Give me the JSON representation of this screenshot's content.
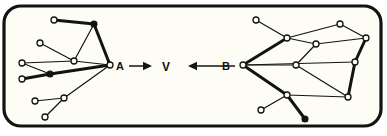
{
  "figure": {
    "background_color": "#ffffff",
    "panel_fill": "#fdfdf6",
    "stroke_color": "#131311",
    "node_fill": "#fdfdf6",
    "frame": {
      "x": 4,
      "y": 6,
      "width": 377,
      "height": 120,
      "radius": 17,
      "stroke_width": 3.2
    }
  },
  "labels": {
    "left_graph": "A",
    "center": "V",
    "right_graph": "B"
  },
  "arrows": {
    "left_to_center": {
      "from_label": "A",
      "to_label": "V",
      "direction": "right",
      "x1": 129,
      "x2": 152,
      "y": 66
    },
    "right_to_center": {
      "from_label": "B",
      "to_label": "V",
      "direction": "left",
      "x1": 235,
      "x2": 188,
      "y": 66
    }
  },
  "graph_left": {
    "anchor_label": "A",
    "anchor": {
      "x": 110,
      "y": 65
    },
    "nodes": [
      {
        "id": "L0",
        "x": 110,
        "y": 65,
        "r": 3.0,
        "style": "open"
      },
      {
        "id": "L1",
        "x": 54,
        "y": 20,
        "r": 3.0,
        "style": "open"
      },
      {
        "id": "L2",
        "x": 94,
        "y": 24,
        "r": 3.0,
        "style": "solid"
      },
      {
        "id": "L3",
        "x": 40,
        "y": 43,
        "r": 3.0,
        "style": "open"
      },
      {
        "id": "L4",
        "x": 74,
        "y": 61,
        "r": 3.0,
        "style": "open"
      },
      {
        "id": "L5",
        "x": 22,
        "y": 63,
        "r": 3.0,
        "style": "open"
      },
      {
        "id": "L6",
        "x": 50,
        "y": 74,
        "r": 3.0,
        "style": "solid"
      },
      {
        "id": "L7",
        "x": 22,
        "y": 79,
        "r": 3.0,
        "style": "open"
      },
      {
        "id": "L8",
        "x": 35,
        "y": 101,
        "r": 3.0,
        "style": "open"
      },
      {
        "id": "L9",
        "x": 64,
        "y": 98,
        "r": 3.0,
        "style": "open"
      },
      {
        "id": "L10",
        "x": 45,
        "y": 117,
        "r": 3.0,
        "style": "open"
      }
    ],
    "edges": [
      {
        "from": "L1",
        "to": "L2",
        "weight": "thick"
      },
      {
        "from": "L2",
        "to": "L0",
        "weight": "thick"
      },
      {
        "from": "L2",
        "to": "L4",
        "weight": "thin"
      },
      {
        "from": "L4",
        "to": "L0",
        "weight": "thin"
      },
      {
        "from": "L3",
        "to": "L4",
        "weight": "thin"
      },
      {
        "from": "L5",
        "to": "L4",
        "weight": "thin"
      },
      {
        "from": "L5",
        "to": "L6",
        "weight": "thin"
      },
      {
        "from": "L6",
        "to": "L0",
        "weight": "thick"
      },
      {
        "from": "L7",
        "to": "L6",
        "weight": "thick"
      },
      {
        "from": "L7",
        "to": "L0",
        "weight": "thin"
      },
      {
        "from": "L8",
        "to": "L9",
        "weight": "thin"
      },
      {
        "from": "L9",
        "to": "L0",
        "weight": "thin"
      },
      {
        "from": "L10",
        "to": "L9",
        "weight": "thin"
      }
    ]
  },
  "graph_right": {
    "anchor_label": "B",
    "anchor": {
      "x": 243,
      "y": 65
    },
    "nodes": [
      {
        "id": "R0",
        "x": 243,
        "y": 65,
        "r": 3.0,
        "style": "open"
      },
      {
        "id": "R1",
        "x": 256,
        "y": 20,
        "r": 3.0,
        "style": "open"
      },
      {
        "id": "R2",
        "x": 287,
        "y": 38,
        "r": 3.0,
        "style": "open"
      },
      {
        "id": "R3",
        "x": 340,
        "y": 24,
        "r": 3.0,
        "style": "open"
      },
      {
        "id": "R4",
        "x": 316,
        "y": 44,
        "r": 3.0,
        "style": "open"
      },
      {
        "id": "R5",
        "x": 366,
        "y": 38,
        "r": 3.0,
        "style": "open"
      },
      {
        "id": "R6",
        "x": 296,
        "y": 65,
        "r": 3.0,
        "style": "open"
      },
      {
        "id": "R7",
        "x": 355,
        "y": 62,
        "r": 3.0,
        "style": "open"
      },
      {
        "id": "R8",
        "x": 287,
        "y": 95,
        "r": 3.0,
        "style": "open"
      },
      {
        "id": "R9",
        "x": 348,
        "y": 97,
        "r": 3.0,
        "style": "open"
      },
      {
        "id": "R10",
        "x": 261,
        "y": 110,
        "r": 3.0,
        "style": "open"
      },
      {
        "id": "R11",
        "x": 305,
        "y": 119,
        "r": 3.0,
        "style": "solid"
      }
    ],
    "edges": [
      {
        "from": "R1",
        "to": "R2",
        "weight": "thin"
      },
      {
        "from": "R2",
        "to": "R0",
        "weight": "thick"
      },
      {
        "from": "R2",
        "to": "R4",
        "weight": "thin"
      },
      {
        "from": "R2",
        "to": "R3",
        "weight": "thin"
      },
      {
        "from": "R3",
        "to": "R5",
        "weight": "thin"
      },
      {
        "from": "R4",
        "to": "R5",
        "weight": "thin"
      },
      {
        "from": "R4",
        "to": "R6",
        "weight": "thin"
      },
      {
        "from": "R6",
        "to": "R0",
        "weight": "thin"
      },
      {
        "from": "R0",
        "to": "R7",
        "weight": "thin"
      },
      {
        "from": "R5",
        "to": "R7",
        "weight": "thick"
      },
      {
        "from": "R7",
        "to": "R9",
        "weight": "thick"
      },
      {
        "from": "R6",
        "to": "R9",
        "weight": "thin"
      },
      {
        "from": "R8",
        "to": "R9",
        "weight": "thin"
      },
      {
        "from": "R0",
        "to": "R8",
        "weight": "thick"
      },
      {
        "from": "R8",
        "to": "R10",
        "weight": "thin"
      },
      {
        "from": "R8",
        "to": "R11",
        "weight": "thick"
      }
    ]
  }
}
